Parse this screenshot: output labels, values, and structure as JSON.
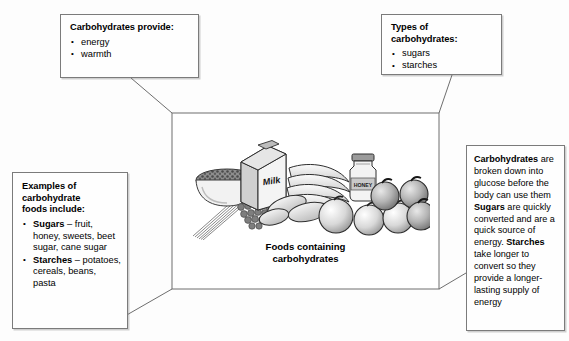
{
  "diagram": {
    "center": {
      "caption_line1": "Foods containing",
      "caption_line2": "carbohydrates",
      "illustration_items": [
        "bowl-of-cereal",
        "spaghetti",
        "grapes",
        "milk-carton",
        "bread-rolls",
        "bananas",
        "honey-jar",
        "oranges",
        "apples"
      ],
      "milk_carton_label": "Milk",
      "honey_jar_label": "HONEY"
    },
    "boxes": {
      "provide": {
        "title": "Carbohydrates provide:",
        "bullets": [
          "energy",
          "warmth"
        ]
      },
      "types": {
        "title": "Types of carbohydrates:",
        "bullets": [
          "sugars",
          "starches"
        ]
      },
      "examples": {
        "title_line1": "Examples of",
        "title_line2": "carbohydrate",
        "title_line3": "foods include:",
        "bullets": [
          {
            "lead": "Sugars",
            "text": " – fruit, honey, sweets, beet sugar, cane sugar"
          },
          {
            "lead": "Starches",
            "text": " – potatoes, cereals, beans, pasta"
          }
        ]
      },
      "digestion": {
        "segments": [
          {
            "text": "Carbohydrates",
            "bold": true
          },
          {
            "text": " are broken down into glucose before the body can use them ",
            "bold": false
          },
          {
            "text": "Sugars",
            "bold": true
          },
          {
            "text": " are quickly converted and are a quick source of energy. ",
            "bold": false
          },
          {
            "text": "Starches",
            "bold": true
          },
          {
            "text": " take longer to convert so they provide a longer-lasting supply of energy",
            "bold": false
          }
        ]
      }
    },
    "colors": {
      "line": "#6e6e6e",
      "box_border": "#7b7b7b",
      "background": "#ffffff",
      "text": "#000000"
    }
  }
}
